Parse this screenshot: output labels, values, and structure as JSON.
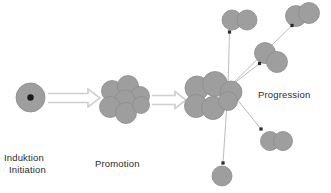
{
  "figure": {
    "type": "diagram",
    "background_color": "#ffffff",
    "cell_fill_color": "#9e9e9e",
    "cell_stroke_color": "#8c8c8c",
    "nucleus_color": "#1a1a1a",
    "arrow_stroke_color": "#cfcfcf",
    "thin_line_color": "#b4b4b4",
    "arrowhead_color": "#2b2b2b",
    "text_color": "#2b2b2b"
  },
  "labels": {
    "induction": {
      "line1": "Induktion",
      "line2": "Initiation"
    },
    "promotion": "Promotion",
    "progression": "Progression"
  },
  "stages": [
    {
      "id": "induction",
      "label": "Induktion / Initiation",
      "cell_count": 1,
      "has_nucleus": true,
      "cells": [
        {
          "cx": 30.5,
          "cy": 97.5,
          "r": 14.5
        }
      ],
      "nucleus": {
        "cx": 30.5,
        "cy": 97.5,
        "r": 3.2
      }
    },
    {
      "id": "promotion",
      "label": "Promotion",
      "cell_count": 7,
      "has_nucleus": false,
      "cells": [
        {
          "cx": 112.0,
          "cy": 91.0,
          "r": 10.5
        },
        {
          "cx": 128.0,
          "cy": 86.0,
          "r": 10.5
        },
        {
          "cx": 140.0,
          "cy": 96.0,
          "r": 9.5
        },
        {
          "cx": 125.0,
          "cy": 100.0,
          "r": 10.0
        },
        {
          "cx": 110.0,
          "cy": 107.0,
          "r": 10.5
        },
        {
          "cx": 126.0,
          "cy": 113.0,
          "r": 10.5
        },
        {
          "cx": 141.0,
          "cy": 105.0,
          "r": 8.5
        }
      ]
    },
    {
      "id": "progression",
      "label": "Progression",
      "cell_count": 6,
      "has_nucleus": false,
      "cells": [
        {
          "cx": 197.0,
          "cy": 88.0,
          "r": 12.0
        },
        {
          "cx": 215.0,
          "cy": 84.0,
          "r": 12.5
        },
        {
          "cx": 231.0,
          "cy": 92.0,
          "r": 11.0
        },
        {
          "cx": 196.0,
          "cy": 106.0,
          "r": 11.5
        },
        {
          "cx": 213.0,
          "cy": 108.0,
          "r": 11.5
        },
        {
          "cx": 228.0,
          "cy": 101.0,
          "r": 9.5
        }
      ],
      "origin": {
        "x": 228.0,
        "y": 88.0
      }
    }
  ],
  "block_arrows": [
    {
      "id": "arrow-induction-to-promotion",
      "x1": 48,
      "x2": 100,
      "y": 98,
      "half_height": 4.5,
      "head_length": 12,
      "head_half_height": 9
    },
    {
      "id": "arrow-promotion-to-progression",
      "x1": 152,
      "x2": 186,
      "y": 100,
      "half_height": 4.5,
      "head_length": 11,
      "head_half_height": 8.5
    }
  ],
  "metastases": [
    {
      "id": "metastasis-top-left",
      "position": "top-left",
      "cell_count": 2,
      "arrow_tip": {
        "x": 229.5,
        "y": 32.0
      },
      "cells": [
        {
          "cx": 232.0,
          "cy": 20.0,
          "r": 10.0
        },
        {
          "cx": 247.0,
          "cy": 20.0,
          "r": 10.0
        }
      ]
    },
    {
      "id": "metastasis-top-right",
      "position": "top-right",
      "cell_count": 2,
      "arrow_tip": {
        "x": 292.0,
        "y": 25.5
      },
      "cells": [
        {
          "cx": 296.0,
          "cy": 16.0,
          "r": 10.5
        },
        {
          "cx": 309.0,
          "cy": 13.0,
          "r": 10.5
        }
      ]
    },
    {
      "id": "metastasis-middle-right",
      "position": "middle-right",
      "cell_count": 2,
      "arrow_tip": {
        "x": 259.5,
        "y": 63.5
      },
      "cells": [
        {
          "cx": 265.0,
          "cy": 53.0,
          "r": 10.5
        },
        {
          "cx": 277.0,
          "cy": 62.0,
          "r": 10.5
        }
      ]
    },
    {
      "id": "metastasis-lower-right",
      "position": "lower-right",
      "cell_count": 2,
      "arrow_tip": {
        "x": 261.0,
        "y": 129.0
      },
      "cells": [
        {
          "cx": 270.0,
          "cy": 141.0,
          "r": 9.5
        },
        {
          "cx": 283.0,
          "cy": 141.0,
          "r": 9.5
        }
      ]
    },
    {
      "id": "metastasis-bottom",
      "position": "bottom",
      "cell_count": 1,
      "arrow_tip": {
        "x": 223.0,
        "y": 163.0
      },
      "cells": [
        {
          "cx": 222.0,
          "cy": 176.0,
          "r": 10.0
        }
      ]
    }
  ]
}
